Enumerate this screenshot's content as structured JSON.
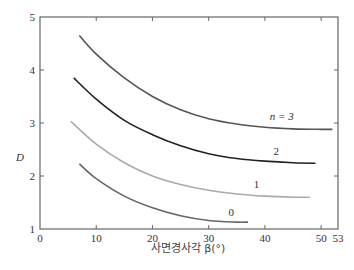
{
  "chart_data": {
    "type": "line",
    "title": "",
    "xlabel": "사면경사각 β(°)",
    "ylabel": "D",
    "xlim": [
      0,
      53
    ],
    "ylim": [
      1,
      5
    ],
    "x_ticks": [
      0,
      10,
      20,
      30,
      40,
      50,
      53
    ],
    "y_ticks": [
      1,
      2,
      3,
      4,
      5
    ],
    "grid": false,
    "legend": "inline curve labels",
    "series": [
      {
        "name": "n = 3",
        "label": "n = 3",
        "color": "#555555",
        "x": [
          7,
          10,
          15,
          20,
          25,
          30,
          35,
          40,
          45,
          50,
          52
        ],
        "y": [
          4.65,
          4.3,
          3.85,
          3.5,
          3.25,
          3.08,
          2.98,
          2.92,
          2.89,
          2.88,
          2.88
        ]
      },
      {
        "name": "n = 2",
        "label": "2",
        "color": "#222222",
        "x": [
          6,
          10,
          15,
          20,
          25,
          30,
          35,
          40,
          45,
          49
        ],
        "y": [
          3.85,
          3.45,
          3.05,
          2.78,
          2.57,
          2.42,
          2.33,
          2.28,
          2.25,
          2.24
        ]
      },
      {
        "name": "n = 1",
        "label": "1",
        "color": "#aaaaaa",
        "x": [
          5.5,
          10,
          15,
          20,
          25,
          30,
          35,
          40,
          45,
          48
        ],
        "y": [
          3.03,
          2.6,
          2.25,
          2.0,
          1.84,
          1.73,
          1.66,
          1.62,
          1.6,
          1.6
        ]
      },
      {
        "name": "n = 0",
        "label": "0",
        "color": "#666666",
        "x": [
          7,
          10,
          15,
          20,
          25,
          30,
          35,
          37
        ],
        "y": [
          2.23,
          1.95,
          1.62,
          1.4,
          1.25,
          1.16,
          1.13,
          1.13
        ]
      }
    ],
    "annotations": [
      {
        "text": "n = 3",
        "x": 43,
        "y": 3.05
      },
      {
        "text": "2",
        "x": 42,
        "y": 2.4
      },
      {
        "text": "1",
        "x": 38.5,
        "y": 1.78
      },
      {
        "text": "0",
        "x": 34,
        "y": 1.25
      }
    ]
  }
}
